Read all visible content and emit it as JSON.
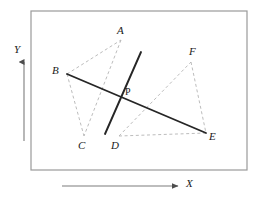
{
  "figure": {
    "background_color": "#ffffff",
    "border": {
      "x": 31,
      "y": 11,
      "width": 216,
      "height": 159,
      "color": "#9a9a9a",
      "stroke_width": 1.2
    },
    "solid_color": "#262626",
    "dashed_color": "#b4b4b4",
    "axis_color": "#7d7d7d"
  },
  "points": {
    "A": {
      "label": "A",
      "x": 121,
      "y": 40,
      "label_x": 117,
      "label_y": 25
    },
    "B": {
      "label": "B",
      "x": 67,
      "y": 74,
      "label_x": 52,
      "label_y": 65
    },
    "C": {
      "label": "C",
      "x": 84,
      "y": 136,
      "label_x": 78,
      "label_y": 140
    },
    "D": {
      "label": "D",
      "x": 119,
      "y": 136,
      "label_x": 111,
      "label_y": 140
    },
    "E": {
      "label": "E",
      "x": 206,
      "y": 133,
      "label_x": 209,
      "label_y": 131
    },
    "F": {
      "label": "F",
      "x": 191,
      "y": 62,
      "label_x": 189,
      "label_y": 46
    },
    "P": {
      "label": "P",
      "x": 121,
      "y": 96,
      "label_x": 125,
      "label_y": 87
    }
  },
  "dashed_segments": [
    {
      "name": "segment-B-A",
      "from": "B",
      "to": "A"
    },
    {
      "name": "segment-A-C",
      "from": "A",
      "to": "C"
    },
    {
      "name": "segment-B-C",
      "from": "B",
      "to": "C"
    },
    {
      "name": "segment-D-F",
      "from": "D",
      "to": "F"
    },
    {
      "name": "segment-F-E",
      "from": "F",
      "to": "E"
    },
    {
      "name": "segment-D-E",
      "from": "D",
      "to": "E"
    }
  ],
  "solid_segments": [
    {
      "name": "segment-B-E",
      "x1": 67,
      "y1": 74,
      "x2": 206,
      "y2": 133
    },
    {
      "name": "segment-through-P",
      "x1": 141,
      "y1": 52,
      "x2": 105,
      "y2": 134
    }
  ],
  "axes": {
    "y": {
      "label": "Y",
      "label_x": 14,
      "label_y": 44,
      "x": 24,
      "y_bottom": 141,
      "y_top": 62
    },
    "x": {
      "label": "X",
      "label_x": 186,
      "label_y": 178,
      "y": 186,
      "x_left": 62,
      "x_right": 178
    }
  }
}
